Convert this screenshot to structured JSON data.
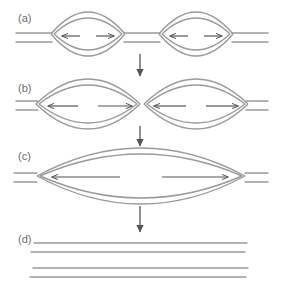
{
  "figure": {
    "width": 282,
    "height": 294,
    "background_color": "#ffffff",
    "strand_color": "#9a9a9a",
    "arrow_color": "#555555",
    "step_arrow_color": "#555555",
    "label_color": "#6b6b6b"
  },
  "panels": [
    {
      "id": "a",
      "label": "(a)",
      "label_x": 18,
      "label_y": 22,
      "description": "Two small replication bubbles on a duplex",
      "axis_y": 38,
      "duplex_gap": 9,
      "bubbles": [
        {
          "cx": 88,
          "cy": 34,
          "rx": 37,
          "ry": 22
        },
        {
          "cx": 196,
          "cy": 34,
          "rx": 37,
          "ry": 22
        }
      ],
      "fork_arrows": [
        {
          "x1": 80,
          "y1": 36,
          "x2": 62,
          "y2": 36,
          "dir": "left"
        },
        {
          "x1": 96,
          "y1": 36,
          "x2": 114,
          "y2": 36,
          "dir": "right"
        },
        {
          "x1": 188,
          "y1": 36,
          "x2": 170,
          "y2": 36,
          "dir": "left"
        },
        {
          "x1": 204,
          "y1": 36,
          "x2": 222,
          "y2": 36,
          "dir": "right"
        }
      ],
      "flank_lines": [
        {
          "x1": 16,
          "x2": 52,
          "y": 33
        },
        {
          "x1": 16,
          "x2": 52,
          "y": 42
        },
        {
          "x1": 124,
          "x2": 160,
          "y": 33
        },
        {
          "x1": 124,
          "x2": 160,
          "y": 42
        },
        {
          "x1": 232,
          "x2": 268,
          "y": 33
        },
        {
          "x1": 232,
          "x2": 268,
          "y": 42
        }
      ]
    },
    {
      "id": "b",
      "label": "(b)",
      "label_x": 18,
      "label_y": 92,
      "description": "Replication bubbles enlarged, forks moving apart",
      "axis_y": 106,
      "duplex_gap": 9,
      "bubbles": [
        {
          "cx": 88,
          "cy": 104,
          "rx": 52,
          "ry": 25
        },
        {
          "cx": 196,
          "cy": 104,
          "rx": 52,
          "ry": 25
        }
      ],
      "fork_arrows": [
        {
          "x1": 78,
          "y1": 106,
          "x2": 48,
          "y2": 106,
          "dir": "left"
        },
        {
          "x1": 98,
          "y1": 106,
          "x2": 132,
          "y2": 106,
          "dir": "right"
        },
        {
          "x1": 186,
          "y1": 106,
          "x2": 154,
          "y2": 106,
          "dir": "left"
        },
        {
          "x1": 206,
          "y1": 106,
          "x2": 238,
          "y2": 106,
          "dir": "right"
        }
      ],
      "flank_lines": [
        {
          "x1": 16,
          "x2": 38,
          "y": 101
        },
        {
          "x1": 16,
          "x2": 38,
          "y": 110
        },
        {
          "x1": 246,
          "x2": 268,
          "y": 101
        },
        {
          "x1": 246,
          "x2": 268,
          "y": 110
        }
      ]
    },
    {
      "id": "c",
      "label": "(c)",
      "label_x": 18,
      "label_y": 160,
      "description": "Bubbles fused into one large replication eye",
      "axis_y": 178,
      "duplex_gap": 9,
      "bubbles": [
        {
          "cx": 141,
          "cy": 176,
          "rx": 104,
          "ry": 28
        }
      ],
      "fork_arrows": [
        {
          "x1": 120,
          "y1": 177,
          "x2": 52,
          "y2": 177,
          "dir": "left"
        },
        {
          "x1": 162,
          "y1": 177,
          "x2": 228,
          "y2": 177,
          "dir": "right"
        }
      ],
      "flank_lines": [
        {
          "x1": 14,
          "x2": 37,
          "y": 173
        },
        {
          "x1": 14,
          "x2": 37,
          "y": 182
        },
        {
          "x1": 245,
          "x2": 268,
          "y": 173
        },
        {
          "x1": 245,
          "x2": 268,
          "y": 182
        }
      ]
    },
    {
      "id": "d",
      "label": "(d)",
      "label_x": 18,
      "label_y": 243,
      "description": "Two completed daughter duplexes",
      "axis_y": 260,
      "duplex_gap": 9,
      "bubbles": [],
      "fork_arrows": [],
      "flank_lines": [
        {
          "x1": 34,
          "x2": 247,
          "y": 243
        },
        {
          "x1": 31,
          "x2": 245,
          "y": 252
        },
        {
          "x1": 33,
          "x2": 248,
          "y": 268
        },
        {
          "x1": 30,
          "x2": 246,
          "y": 277
        }
      ]
    }
  ],
  "step_arrows": [
    {
      "name": "arrow-a-to-b",
      "x": 140,
      "y1": 54,
      "y2": 76
    },
    {
      "name": "arrow-b-to-c",
      "x": 140,
      "y1": 126,
      "y2": 146
    },
    {
      "name": "arrow-c-to-d",
      "x": 140,
      "y1": 206,
      "y2": 232
    }
  ]
}
